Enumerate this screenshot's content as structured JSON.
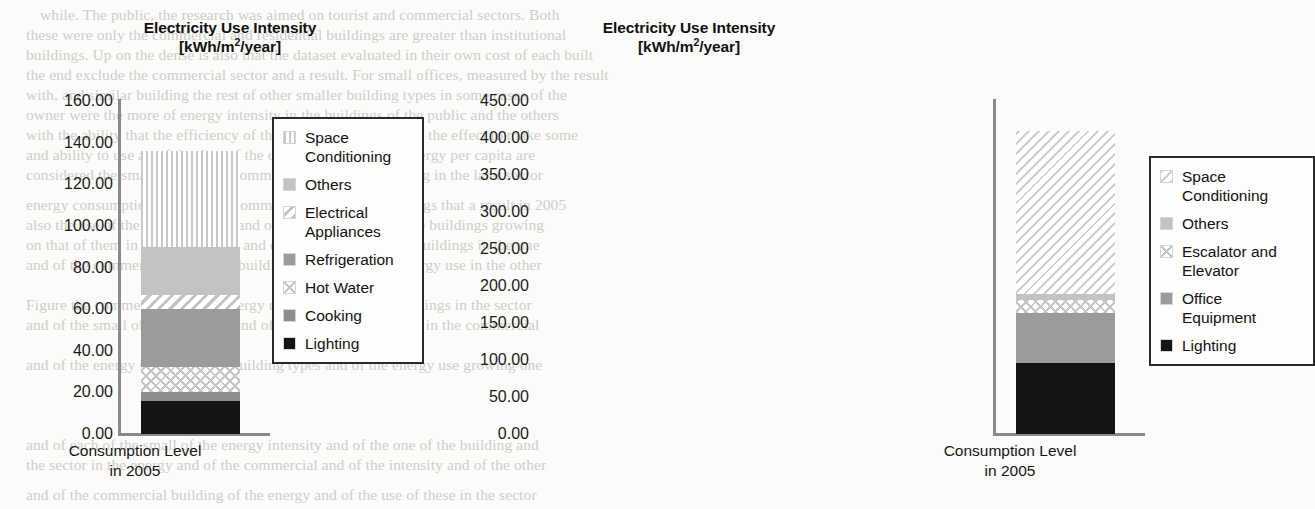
{
  "background_text": {
    "lines": [
      {
        "x": 40,
        "y": 6,
        "text": "while. The public, the research was aimed on tourist and commercial sectors. Both"
      },
      {
        "x": 26,
        "y": 26,
        "text": "these were only the commercial and residential buildings are greater than institutional"
      },
      {
        "x": 26,
        "y": 46,
        "text": "buildings. Up on the dense is also that the dataset evaluated in their own cost of each built"
      },
      {
        "x": 26,
        "y": 66,
        "text": "the end exclude the commercial sector and a result. For small offices, measured by the result"
      },
      {
        "x": 26,
        "y": 86,
        "text": "with, and similar building the rest of other smaller building types in some cases of the"
      },
      {
        "x": 26,
        "y": 106,
        "text": "owner were the more of energy intensity in the buildings of the public and the others"
      },
      {
        "x": 26,
        "y": 126,
        "text": "with the ability that the efficiency of the new building is one of the effect to make some"
      },
      {
        "x": 26,
        "y": 146,
        "text": "and ability to use an of the data of the other state one of the energy per capita are"
      },
      {
        "x": 26,
        "y": 166,
        "text": "considered the small area on the commercial and of the building in the later sector"
      },
      {
        "x": 26,
        "y": 196,
        "text": "energy consumption and a small commercial and office buildings that a result in 2005"
      },
      {
        "x": 26,
        "y": 216,
        "text": "also the use of the building types and of the energy use of these buildings growing"
      },
      {
        "x": 26,
        "y": 236,
        "text": "on that of them in the commercial and energy intensity of the buildings in the one"
      },
      {
        "x": 26,
        "y": 256,
        "text": "and of the commercial and of the building types and of the energy use in the other"
      },
      {
        "x": 26,
        "y": 296,
        "text": "Figure the commercial and the energy use intensity of the buildings in the sector"
      },
      {
        "x": 26,
        "y": 316,
        "text": "and of the small offices building and of the energy use of these in the commercial"
      },
      {
        "x": 26,
        "y": 356,
        "text": "and of the energy use and of the building types and of the energy use growing one"
      },
      {
        "x": 26,
        "y": 436,
        "text": "and of each of the small of the energy intensity and of the one of the building and"
      },
      {
        "x": 26,
        "y": 456,
        "text": "the sector in the energy and of the commercial and of the intensity and of the other"
      },
      {
        "x": 26,
        "y": 486,
        "text": "and of the commercial building of the energy and of the use of these in the sector"
      }
    ]
  },
  "charts": [
    {
      "id": "left",
      "title_line1": "Electricity Use Intensity",
      "title_unit_prefix": "[kWh/m",
      "title_unit_sup": "2",
      "title_unit_suffix": "/year]",
      "xlabel_line1": "Consumption Level",
      "xlabel_line2": "in 2005",
      "yaxis": {
        "min": 0,
        "max": 160,
        "step": 20,
        "ticks": [
          "160.00",
          "140.00",
          "120.00",
          "100.00",
          "80.00",
          "60.00",
          "40.00",
          "20.00",
          "0.00"
        ]
      },
      "legend": [
        {
          "label": "Space\nConditioning",
          "pattern": "f-vstripe"
        },
        {
          "label": "Others",
          "pattern": "f-ltgray"
        },
        {
          "label": "Electrical\nAppliances",
          "pattern": "f-dstripe"
        },
        {
          "label": "Refrigeration",
          "pattern": "f-mdgray"
        },
        {
          "label": "Hot Water",
          "pattern": "f-cross"
        },
        {
          "label": "Cooking",
          "pattern": "f-dkgray"
        },
        {
          "label": "Lighting",
          "pattern": "f-black"
        }
      ]
    },
    {
      "id": "right",
      "title_line1": "Electricity Use Intensity",
      "title_unit_prefix": "[kWh/m",
      "title_unit_sup": "2",
      "title_unit_suffix": "/year]",
      "xlabel_line1": "Consumption Level",
      "xlabel_line2": "in 2005",
      "yaxis": {
        "min": 0,
        "max": 450,
        "step": 50,
        "ticks": [
          "450.00",
          "400.00",
          "350.00",
          "300.00",
          "250.00",
          "200.00",
          "150.00",
          "100.00",
          "50.00",
          "0.00"
        ]
      },
      "legend": [
        {
          "label": "Space\nConditioning",
          "pattern": "f-dstripe-thin"
        },
        {
          "label": "Others",
          "pattern": "f-ltgray"
        },
        {
          "label": "Escalator and\nElevator",
          "pattern": "f-cross"
        },
        {
          "label": "Office\nEquipment",
          "pattern": "f-mdgray"
        },
        {
          "label": "Lighting",
          "pattern": "f-black"
        }
      ]
    }
  ],
  "chart_data": [
    {
      "type": "bar",
      "stacked": true,
      "title": "Electricity Use Intensity [kWh/m2/year]",
      "xlabel": "Consumption Level in 2005",
      "ylabel": "kWh/m2/year",
      "categories": [
        "Consumption Level in 2005"
      ],
      "ylim": [
        0,
        160
      ],
      "ytick_step": 20,
      "grid": false,
      "legend_position": "right",
      "total": 136,
      "series": [
        {
          "name": "Lighting",
          "values": [
            16
          ],
          "pattern": "solid-black",
          "color": "#141414"
        },
        {
          "name": "Cooking",
          "values": [
            4
          ],
          "pattern": "solid-dark-gray",
          "color": "#8e8e8e"
        },
        {
          "name": "Hot Water",
          "values": [
            12
          ],
          "pattern": "crosshatch",
          "color": "#c6c6c6"
        },
        {
          "name": "Refrigeration",
          "values": [
            28
          ],
          "pattern": "solid-mid-gray",
          "color": "#9b9b9b"
        },
        {
          "name": "Electrical Appliances",
          "values": [
            7
          ],
          "pattern": "diagonal-stripe",
          "color": "#c4c4c4"
        },
        {
          "name": "Others",
          "values": [
            23
          ],
          "pattern": "solid-light-gray",
          "color": "#c3c3c3"
        },
        {
          "name": "Space Conditioning",
          "values": [
            46
          ],
          "pattern": "vertical-stripe",
          "color": "#c9c9c9"
        }
      ]
    },
    {
      "type": "bar",
      "stacked": true,
      "title": "Electricity Use Intensity [kWh/m2/year]",
      "xlabel": "Consumption Level in 2005",
      "ylabel": "kWh/m2/year",
      "categories": [
        "Consumption Level in 2005"
      ],
      "ylim": [
        0,
        450
      ],
      "ytick_step": 50,
      "grid": false,
      "legend_position": "right",
      "total": 409,
      "series": [
        {
          "name": "Lighting",
          "values": [
            96
          ],
          "pattern": "solid-black",
          "color": "#141414"
        },
        {
          "name": "Office Equipment",
          "values": [
            67
          ],
          "pattern": "solid-mid-gray",
          "color": "#9b9b9b"
        },
        {
          "name": "Escalator and Elevator",
          "values": [
            18
          ],
          "pattern": "crosshatch",
          "color": "#c6c6c6"
        },
        {
          "name": "Others",
          "values": [
            8
          ],
          "pattern": "solid-light-gray",
          "color": "#c3c3c3"
        },
        {
          "name": "Space Conditioning",
          "values": [
            220
          ],
          "pattern": "diagonal-stripe",
          "color": "#cfcfcf"
        }
      ]
    }
  ]
}
